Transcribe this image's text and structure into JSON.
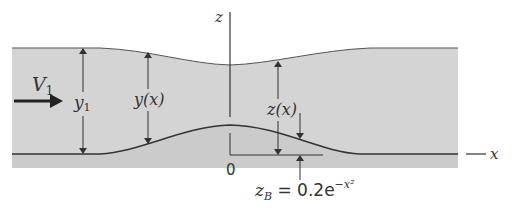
{
  "figure": {
    "type": "open-channel flow over a bottom bump",
    "colors": {
      "water_fill": "#d3d3d3",
      "bed_fill": "#cfcfcf",
      "line": "#333333",
      "background": "#ffffff"
    }
  },
  "labels": {
    "velocity": "V",
    "velocity_sub": "1",
    "upstream_depth": "y",
    "upstream_depth_sub": "1",
    "local_depth": "y(x)",
    "surface_elevation": "z(x)",
    "vertical_axis": "z",
    "horizontal_axis": "x",
    "origin": "0",
    "bump_equation_lhs": "z",
    "bump_equation_sub": "B",
    "bump_equation_rhs": " = 0.2e",
    "bump_equation_exp": "−x²"
  }
}
